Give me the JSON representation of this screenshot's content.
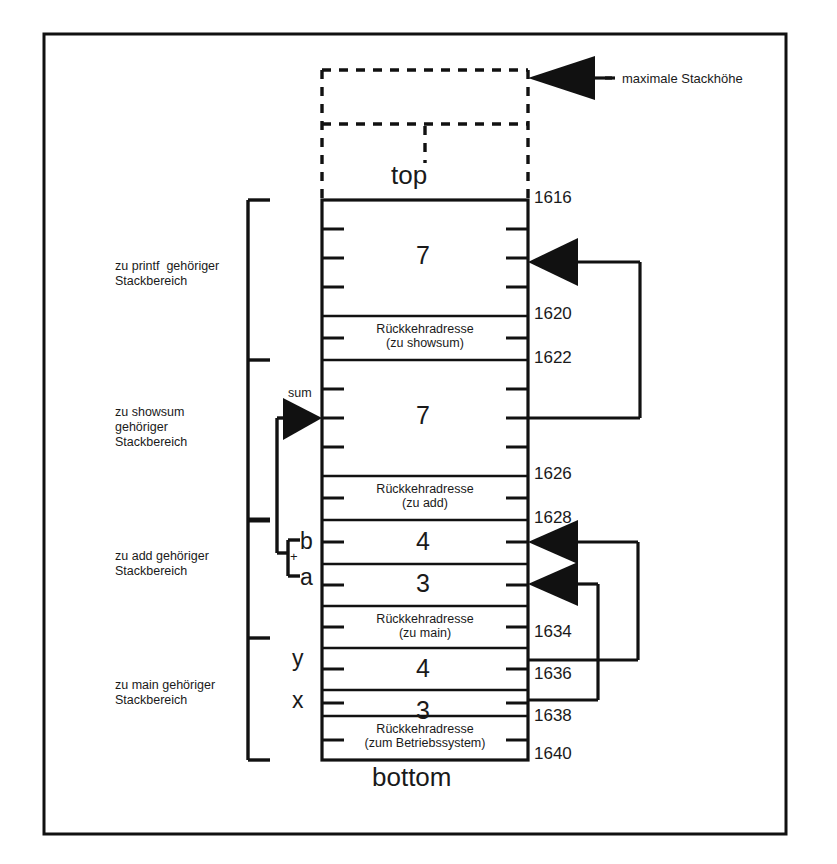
{
  "diagram": {
    "title_label_top": "top",
    "title_label_bottom": "bottom",
    "max_stack_label": "maximale Stackhöhe"
  },
  "regions": [
    {
      "name": "printf",
      "label": "zu printf  gehöriger\nStackbereich"
    },
    {
      "name": "showsum",
      "label": "zu showsum\ngehöriger\nStackbereich"
    },
    {
      "name": "add",
      "label": "zu add gehöriger\nStackbereich"
    },
    {
      "name": "main",
      "label": "zu main gehöriger\nStackbereich"
    }
  ],
  "cells": [
    {
      "id": "printf-value",
      "text": "7",
      "kind": "value"
    },
    {
      "id": "ret-showsum",
      "text": "Rückkehradresse\n(zu showsum)",
      "kind": "return"
    },
    {
      "id": "showsum-value",
      "text": "7",
      "kind": "value"
    },
    {
      "id": "ret-add",
      "text": "Rückkehradresse\n(zu add)",
      "kind": "return"
    },
    {
      "id": "add-b",
      "text": "4",
      "kind": "value"
    },
    {
      "id": "add-a",
      "text": "3",
      "kind": "value"
    },
    {
      "id": "ret-main",
      "text": "Rückkehradresse\n(zu main)",
      "kind": "return"
    },
    {
      "id": "main-y",
      "text": "4",
      "kind": "value"
    },
    {
      "id": "main-x",
      "text": "3",
      "kind": "value"
    },
    {
      "id": "ret-os",
      "text": "Rückkehradresse\n(zum Betriebssystem)",
      "kind": "return"
    }
  ],
  "addresses": [
    {
      "value": "1616"
    },
    {
      "value": "1620"
    },
    {
      "value": "1622"
    },
    {
      "value": "1626"
    },
    {
      "value": "1628"
    },
    {
      "value": "1634"
    },
    {
      "value": "1636"
    },
    {
      "value": "1638"
    },
    {
      "value": "1640"
    }
  ],
  "variables": {
    "sum": "sum",
    "b": "b",
    "a": "a",
    "plus": "+",
    "y": "y",
    "x": "x"
  },
  "colors": {
    "ink": "#1a1a1a",
    "line": "#000000",
    "background": "#ffffff"
  }
}
